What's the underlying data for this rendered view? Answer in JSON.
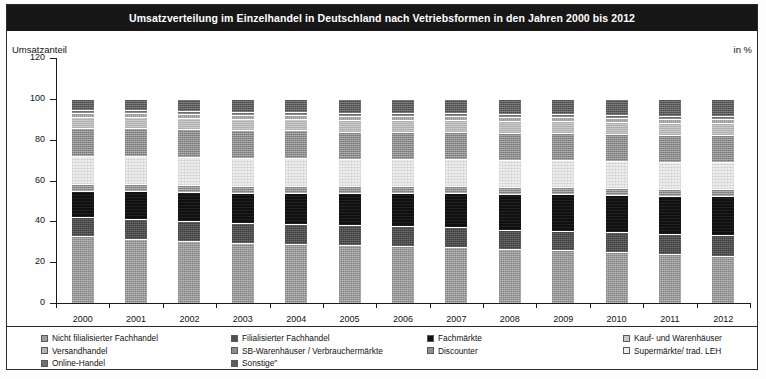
{
  "header": {
    "title": "Umsatzverteilung im Einzelhandel in Deutschland nach Vetriebsformen in den Jahren 2000 bis 2012"
  },
  "axis_captions": {
    "left": "Umsatzanteil",
    "right": "in %"
  },
  "chart_data": {
    "type": "bar",
    "stacked": true,
    "title": "Umsatzverteilung im Einzelhandel in Deutschland nach Vetriebsformen in den Jahren 2000 bis 2012",
    "xlabel": "",
    "ylabel": "Umsatzanteil",
    "unit": "in %",
    "ylim": [
      0,
      120
    ],
    "yticks": [
      0,
      20,
      40,
      60,
      80,
      100,
      120
    ],
    "grid": false,
    "legend_position": "bottom",
    "categories": [
      "2000",
      "2001",
      "2002",
      "2003",
      "2004",
      "2005",
      "2006",
      "2007",
      "2008",
      "2009",
      "2010",
      "2011",
      "2012"
    ],
    "series": [
      {
        "name": "Nicht filialisierter Fachhandel",
        "color": "#9b9b9b",
        "values": [
          33.0,
          31.5,
          30.5,
          29.5,
          29.0,
          28.5,
          28.0,
          27.5,
          26.5,
          26.0,
          25.0,
          24.0,
          23.0
        ]
      },
      {
        "name": "Filialisierter Fachhandel",
        "color": "#4f4f4f",
        "values": [
          9.0,
          9.5,
          9.5,
          9.5,
          9.5,
          9.5,
          9.5,
          9.5,
          9.5,
          9.5,
          10.0,
          10.0,
          10.5
        ]
      },
      {
        "name": "Fachmärkte",
        "color": "#101010",
        "values": [
          13.0,
          14.0,
          14.5,
          15.0,
          15.5,
          16.0,
          16.5,
          17.0,
          17.5,
          18.0,
          18.0,
          18.5,
          19.0
        ]
      },
      {
        "name": "Discounter",
        "color": "#8e8e8e",
        "values": [
          3.5,
          3.5,
          3.5,
          3.5,
          3.5,
          3.5,
          3.5,
          3.5,
          3.5,
          3.5,
          3.5,
          3.5,
          3.5
        ]
      },
      {
        "name": "Supermärkte/ trad. LEH",
        "color": "#ededed",
        "values": [
          13.5,
          13.5,
          13.5,
          13.5,
          13.5,
          13.0,
          13.0,
          13.0,
          13.0,
          13.0,
          13.0,
          13.0,
          13.0
        ]
      },
      {
        "name": "SB-Warenhäuser / Verbrauchermärkte",
        "color": "#8d8d8d",
        "values": [
          13.5,
          13.5,
          13.5,
          13.5,
          13.5,
          13.5,
          13.5,
          13.5,
          13.5,
          13.5,
          13.5,
          13.5,
          13.5
        ]
      },
      {
        "name": "Kauf- und Warenhäuser",
        "color": "#c9c9c9",
        "values": [
          5.5,
          5.5,
          5.5,
          5.5,
          5.5,
          5.5,
          5.5,
          5.5,
          5.5,
          5.5,
          5.5,
          5.5,
          5.5
        ]
      },
      {
        "name": "Versandhandel",
        "color": "#b4b4b4",
        "values": [
          2.0,
          2.0,
          2.0,
          2.0,
          2.0,
          2.0,
          2.0,
          2.0,
          2.0,
          2.0,
          2.0,
          2.0,
          2.0
        ]
      },
      {
        "name": "Online-Handel",
        "color": "#6f6f6f",
        "values": [
          1.5,
          1.5,
          1.5,
          1.5,
          1.5,
          1.5,
          1.5,
          1.5,
          1.5,
          1.5,
          1.5,
          1.5,
          1.5
        ]
      },
      {
        "name": "Sonstige*",
        "color": "#5c5c5c",
        "values": [
          5.5,
          5.5,
          6.0,
          6.5,
          6.5,
          7.0,
          7.0,
          7.0,
          7.5,
          7.5,
          8.0,
          8.5,
          8.5
        ]
      }
    ]
  },
  "legend": {
    "columns": [
      {
        "items": [
          {
            "label": "Nicht filialisierter Fachhandel",
            "color": "#9b9b9b"
          },
          {
            "label": "Versandhandel",
            "color": "#b4b4b4"
          },
          {
            "label": "Online-Handel",
            "color": "#6f6f6f"
          }
        ]
      },
      {
        "items": [
          {
            "label": "Filialisierter Fachhandel",
            "color": "#4f4f4f"
          },
          {
            "label": "SB-Warenhäuser / Verbrauchermärkte",
            "color": "#8d8d8d"
          },
          {
            "label": "Sonstige\"",
            "color": "#5c5c5c"
          }
        ]
      },
      {
        "items": [
          {
            "label": "Fachmärkte",
            "color": "#101010"
          },
          {
            "label": "Discounter",
            "color": "#8e8e8e"
          }
        ]
      },
      {
        "items": [
          {
            "label": "Kauf- und Warenhäuser",
            "color": "#c9c9c9"
          },
          {
            "label": "Supermärkte/ trad. LEH",
            "color": "#ededed"
          }
        ]
      }
    ]
  }
}
